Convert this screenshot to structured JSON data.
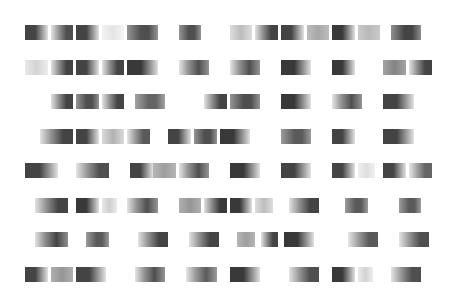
{
  "pattern": {
    "description": "Abstract grid of horizontal grayscale gradient blocks",
    "rows": [
      {
        "blocks": [
          {
            "c": 0,
            "s": 1,
            "g": "dark-fade-right",
            "d": 0.85
          },
          {
            "c": 1,
            "s": 1,
            "g": "fade-in-dark",
            "d": 0.8
          },
          {
            "c": 2,
            "s": 1,
            "g": "dark-fade-right",
            "d": 0.85
          },
          {
            "c": 3,
            "s": 1,
            "g": "faint",
            "d": 0.12
          },
          {
            "c": 4,
            "s": 1.3,
            "g": "mid-dark",
            "d": 0.8
          },
          {
            "c": 6,
            "s": 1,
            "g": "mid-dark",
            "d": 0.8
          },
          {
            "c": 8,
            "s": 1,
            "g": "faint-mid",
            "d": 0.3
          },
          {
            "c": 9,
            "s": 1,
            "g": "fade-in-dark",
            "d": 0.85
          },
          {
            "c": 10,
            "s": 1,
            "g": "dark-fade-right",
            "d": 0.85
          },
          {
            "c": 11,
            "s": 1,
            "g": "mid",
            "d": 0.5
          },
          {
            "c": 12,
            "s": 1,
            "g": "dark-fade-right",
            "d": 0.9
          },
          {
            "c": 13,
            "s": 1,
            "g": "mid",
            "d": 0.4
          },
          {
            "c": 14.3,
            "s": 1.3,
            "g": "mid-dark",
            "d": 0.85
          }
        ]
      },
      {
        "blocks": [
          {
            "c": 0,
            "s": 1,
            "g": "faint",
            "d": 0.2
          },
          {
            "c": 1,
            "s": 1,
            "g": "fade-in-dark",
            "d": 0.85
          },
          {
            "c": 2,
            "s": 1,
            "g": "dark-fade-right",
            "d": 0.85
          },
          {
            "c": 3,
            "s": 1,
            "g": "fade-in-dark",
            "d": 0.85
          },
          {
            "c": 4,
            "s": 1.3,
            "g": "dark-fade-right",
            "d": 0.9
          },
          {
            "c": 6,
            "s": 1.3,
            "g": "fade-in-mid",
            "d": 0.8
          },
          {
            "c": 8,
            "s": 1.3,
            "g": "fade-in-mid",
            "d": 0.8
          },
          {
            "c": 10,
            "s": 1.3,
            "g": "dark-fade-right",
            "d": 0.9
          },
          {
            "c": 12,
            "s": 1,
            "g": "dark-fade-right",
            "d": 0.9
          },
          {
            "c": 14,
            "s": 1,
            "g": "mid",
            "d": 0.7
          },
          {
            "c": 15,
            "s": 1,
            "g": "fade-in-dark",
            "d": 0.85
          }
        ]
      },
      {
        "blocks": [
          {
            "c": 1,
            "s": 1,
            "g": "fade-in-dark",
            "d": 0.85
          },
          {
            "c": 2,
            "s": 1,
            "g": "mid-dark",
            "d": 0.8
          },
          {
            "c": 3,
            "s": 1,
            "g": "fade-in-dark",
            "d": 0.85
          },
          {
            "c": 4.3,
            "s": 1.3,
            "g": "mid-dark",
            "d": 0.7
          },
          {
            "c": 7,
            "s": 1,
            "g": "fade-in-dark",
            "d": 0.85
          },
          {
            "c": 8,
            "s": 1.3,
            "g": "mid-dark",
            "d": 0.8
          },
          {
            "c": 10,
            "s": 1.3,
            "g": "dark-fade-right",
            "d": 0.9
          },
          {
            "c": 12,
            "s": 1.3,
            "g": "fade-in-mid",
            "d": 0.8
          },
          {
            "c": 14,
            "s": 1.3,
            "g": "dark-fade-right",
            "d": 0.85
          }
        ]
      },
      {
        "blocks": [
          {
            "c": 0.6,
            "s": 1.4,
            "g": "fade-in-dark",
            "d": 0.85
          },
          {
            "c": 2,
            "s": 1,
            "g": "dark-fade-right",
            "d": 0.85
          },
          {
            "c": 3,
            "s": 1,
            "g": "faint-mid",
            "d": 0.35
          },
          {
            "c": 4,
            "s": 1,
            "g": "fade-in-dark",
            "d": 0.75
          },
          {
            "c": 5.6,
            "s": 1,
            "g": "dark-fade-right",
            "d": 0.85
          },
          {
            "c": 6.6,
            "s": 1,
            "g": "mid-dark",
            "d": 0.8
          },
          {
            "c": 7.6,
            "s": 1.3,
            "g": "dark-fade-right",
            "d": 0.9
          },
          {
            "c": 10,
            "s": 1.3,
            "g": "mid-dark",
            "d": 0.75
          },
          {
            "c": 12,
            "s": 1,
            "g": "dark-fade-right",
            "d": 0.85
          },
          {
            "c": 14,
            "s": 1.3,
            "g": "dark-fade-right",
            "d": 0.85
          }
        ]
      },
      {
        "blocks": [
          {
            "c": 0,
            "s": 1.4,
            "g": "dark-fade-right",
            "d": 0.85
          },
          {
            "c": 2,
            "s": 1.4,
            "g": "fade-in-dark",
            "d": 0.8
          },
          {
            "c": 4.1,
            "s": 1,
            "g": "dark-fade-right",
            "d": 0.85
          },
          {
            "c": 5,
            "s": 1,
            "g": "mid",
            "d": 0.55
          },
          {
            "c": 6,
            "s": 1.3,
            "g": "fade-in-mid",
            "d": 0.8
          },
          {
            "c": 8,
            "s": 1.3,
            "g": "dark-fade-right",
            "d": 0.9
          },
          {
            "c": 10,
            "s": 1.3,
            "g": "dark-fade-right",
            "d": 0.85
          },
          {
            "c": 12,
            "s": 1,
            "g": "dark-fade-right",
            "d": 0.85
          },
          {
            "c": 13,
            "s": 0.8,
            "g": "faint",
            "d": 0.15
          },
          {
            "c": 14,
            "s": 1,
            "g": "dark-fade-right",
            "d": 0.85
          },
          {
            "c": 15,
            "s": 1,
            "g": "fade-in-dark",
            "d": 0.7
          }
        ]
      },
      {
        "blocks": [
          {
            "c": 0.4,
            "s": 1.4,
            "g": "fade-in-dark",
            "d": 0.85
          },
          {
            "c": 2,
            "s": 1,
            "g": "dark-fade-right",
            "d": 0.9
          },
          {
            "c": 3,
            "s": 0.7,
            "g": "faint",
            "d": 0.22
          },
          {
            "c": 4,
            "s": 1.3,
            "g": "fade-in-mid",
            "d": 0.8
          },
          {
            "c": 6,
            "s": 1,
            "g": "mid",
            "d": 0.6
          },
          {
            "c": 7,
            "s": 1,
            "g": "fade-in-dark",
            "d": 0.9
          },
          {
            "c": 8,
            "s": 1,
            "g": "dark-fade-right",
            "d": 0.9
          },
          {
            "c": 9,
            "s": 0.8,
            "g": "faint-mid",
            "d": 0.3
          },
          {
            "c": 10.3,
            "s": 1.3,
            "g": "fade-in-dark",
            "d": 0.85
          },
          {
            "c": 12.5,
            "s": 1,
            "g": "mid-dark",
            "d": 0.75
          },
          {
            "c": 14.6,
            "s": 1,
            "g": "mid-dark",
            "d": 0.75
          }
        ]
      },
      {
        "blocks": [
          {
            "c": 0.4,
            "s": 1.4,
            "g": "fade-in-mid",
            "d": 0.85
          },
          {
            "c": 2.4,
            "s": 1,
            "g": "mid-dark",
            "d": 0.75
          },
          {
            "c": 4.4,
            "s": 1.3,
            "g": "fade-in-dark",
            "d": 0.85
          },
          {
            "c": 6.4,
            "s": 1.3,
            "g": "fade-in-dark",
            "d": 0.85
          },
          {
            "c": 8.3,
            "s": 0.8,
            "g": "mid",
            "d": 0.55
          },
          {
            "c": 9.2,
            "s": 0.8,
            "g": "fade-in-dark",
            "d": 0.85
          },
          {
            "c": 10.1,
            "s": 1.3,
            "g": "dark-fade-right",
            "d": 0.9
          },
          {
            "c": 12.6,
            "s": 1.3,
            "g": "fade-in-dark",
            "d": 0.75
          },
          {
            "c": 14.6,
            "s": 1.3,
            "g": "fade-in-dark",
            "d": 0.8
          }
        ]
      },
      {
        "blocks": [
          {
            "c": 0,
            "s": 1,
            "g": "dark-fade-right",
            "d": 0.85
          },
          {
            "c": 1,
            "s": 1,
            "g": "mid",
            "d": 0.6
          },
          {
            "c": 2,
            "s": 1.3,
            "g": "dark-fade-right",
            "d": 0.85
          },
          {
            "c": 4.3,
            "s": 1.3,
            "g": "fade-in-mid",
            "d": 0.8
          },
          {
            "c": 6.3,
            "s": 1.3,
            "g": "fade-in-mid",
            "d": 0.75
          },
          {
            "c": 8,
            "s": 1.3,
            "g": "dark-fade-right",
            "d": 0.9
          },
          {
            "c": 10.3,
            "s": 1.3,
            "g": "fade-in-dark",
            "d": 0.8
          },
          {
            "c": 12,
            "s": 1,
            "g": "dark-fade-right",
            "d": 0.9
          },
          {
            "c": 13,
            "s": 0.7,
            "g": "faint",
            "d": 0.2
          },
          {
            "c": 14.3,
            "s": 1.3,
            "g": "fade-in-dark",
            "d": 0.8
          }
        ]
      }
    ]
  }
}
